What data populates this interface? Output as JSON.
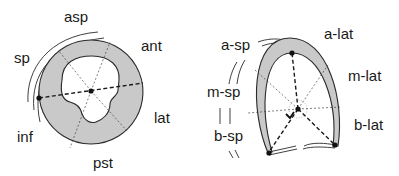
{
  "colors": {
    "wall_fill": "#c9c9c9",
    "stroke": "#2a2a2a",
    "background": "#ffffff"
  },
  "short_axis": {
    "labels": {
      "asp": "asp",
      "ant": "ant",
      "sp": "sp",
      "lat": "lat",
      "inf": "inf",
      "pst": "pst"
    }
  },
  "long_axis": {
    "labels": {
      "a_sp": "a-sp",
      "a_lat": "a-lat",
      "m_sp": "m-sp",
      "m_lat": "m-lat",
      "b_sp": "b-sp",
      "b_lat": "b-lat"
    }
  }
}
